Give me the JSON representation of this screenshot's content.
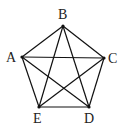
{
  "diagram": {
    "colors": {
      "stroke": "#111111",
      "label": "#222222",
      "background": "#ffffff"
    },
    "vertices": [
      {
        "id": "A",
        "label": "A",
        "x": 22,
        "y": 57,
        "label_x": 6,
        "label_y": 62
      },
      {
        "id": "B",
        "label": "B",
        "x": 63,
        "y": 26,
        "label_x": 58,
        "label_y": 19
      },
      {
        "id": "C",
        "label": "C",
        "x": 104,
        "y": 58,
        "label_x": 108,
        "label_y": 63
      },
      {
        "id": "D",
        "label": "D",
        "x": 89,
        "y": 107,
        "label_x": 84,
        "label_y": 123
      },
      {
        "id": "E",
        "label": "E",
        "x": 39,
        "y": 107,
        "label_x": 33,
        "label_y": 123
      }
    ],
    "edges": [
      [
        "A",
        "B"
      ],
      [
        "B",
        "C"
      ],
      [
        "C",
        "D"
      ],
      [
        "D",
        "E"
      ],
      [
        "E",
        "A"
      ],
      [
        "A",
        "C"
      ],
      [
        "A",
        "D"
      ],
      [
        "B",
        "D"
      ],
      [
        "B",
        "E"
      ],
      [
        "C",
        "E"
      ]
    ]
  }
}
